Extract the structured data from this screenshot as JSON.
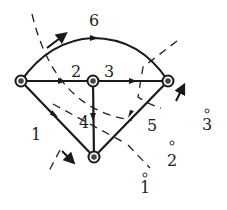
{
  "diagram": {
    "type": "directed graph with cuts",
    "colors": {
      "stroke": "#1a1a1a",
      "node_fill": "#444444",
      "background": "#ffffff"
    },
    "nodes": [
      {
        "id": "left",
        "x": 21,
        "y": 81
      },
      {
        "id": "middle",
        "x": 93,
        "y": 81
      },
      {
        "id": "right",
        "x": 168,
        "y": 81
      },
      {
        "id": "bottom",
        "x": 94,
        "y": 157
      }
    ],
    "edges": [
      {
        "label": "6",
        "from": "left",
        "to": "right",
        "shape": "curve",
        "label_x": 94,
        "label_y": 26
      },
      {
        "label": "2",
        "from": "left",
        "to": "middle",
        "label_x": 76,
        "label_y": 77
      },
      {
        "label": "3",
        "from": "middle",
        "to": "right",
        "label_x": 109,
        "label_y": 77
      },
      {
        "label": "1",
        "from": "left",
        "to": "bottom",
        "label_x": 36,
        "label_y": 140
      },
      {
        "label": "4",
        "from": "middle",
        "to": "bottom",
        "label_x": 84,
        "label_y": 128
      },
      {
        "label": "5",
        "from": "right",
        "to": "bottom",
        "label_x": 152,
        "label_y": 131
      }
    ],
    "cuts": [
      {
        "label": "1",
        "label_x": 145,
        "label_y": 193
      },
      {
        "label": "2",
        "label_x": 172,
        "label_y": 166
      },
      {
        "label": "3",
        "label_x": 207,
        "label_y": 130
      }
    ]
  }
}
